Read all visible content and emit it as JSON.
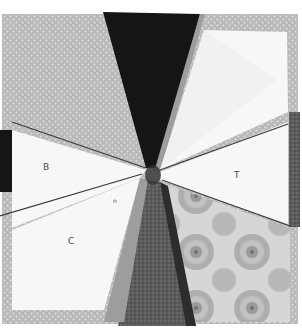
{
  "image": {
    "subject": "Paper-pieced quilt block (kaleidoscope fan) photographed on white background",
    "width": 302,
    "height": 331
  },
  "labels": {
    "b": "B",
    "c": "C",
    "t": "T",
    "n": "n"
  },
  "colors": {
    "background": "#ffffff",
    "dotted_gray": "#b9b9b9",
    "dotted_dot": "#dcdcdc",
    "black_fabric": "#151515",
    "paper_white": "#f7f7f7",
    "paper_shadow": "#ececec",
    "mid_gray_strip": "#9d9d9d",
    "dark_gray_textured": "#5c5c5c",
    "floral_base": "#cfcfcf",
    "floral_flower": "#a9a9a9",
    "seam_line": "#3a3a3a"
  }
}
